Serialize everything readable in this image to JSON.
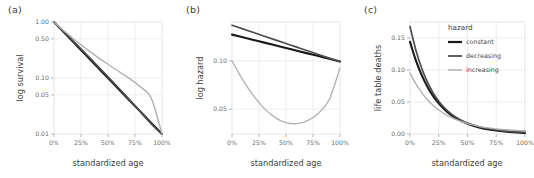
{
  "figure": {
    "background": "#ffffff",
    "panels": [
      {
        "letter": "(a)"
      },
      {
        "letter": "(b)"
      },
      {
        "letter": "(c)"
      }
    ]
  },
  "legend": {
    "title": "hazard",
    "position": "top-right-inside-panel-c",
    "items": [
      {
        "label": "constant",
        "color": "#1a1a1a"
      },
      {
        "label": "decreasing",
        "color": "#4d4d4d"
      },
      {
        "label": "increasing",
        "color": "#b3b3b3"
      }
    ]
  },
  "chart_data": [
    {
      "type": "line",
      "panel": "(a)",
      "title": "",
      "xlabel": "standardized age",
      "ylabel": "log survival",
      "xlim": [
        0,
        100
      ],
      "ylim": [
        0.01,
        1.0
      ],
      "yscale": "log",
      "grid": true,
      "xticks": [
        0,
        25,
        50,
        75,
        100
      ],
      "xticklabels": [
        "0%",
        "25%",
        "50%",
        "75%",
        "100%"
      ],
      "yticks": [
        1.0,
        0.5,
        0.1,
        0.05,
        0.01
      ],
      "yticklabels": [
        "1.00",
        "0.50",
        "0.10",
        "0.05",
        "0.01"
      ],
      "x": [
        0,
        10,
        20,
        30,
        40,
        50,
        60,
        70,
        80,
        90,
        100
      ],
      "series": [
        {
          "name": "constant",
          "color": "#1a1a1a",
          "values": [
            1.0,
            0.631,
            0.398,
            0.251,
            0.158,
            0.1,
            0.0631,
            0.0398,
            0.0251,
            0.0158,
            0.01
          ]
        },
        {
          "name": "decreasing",
          "color": "#4d4d4d",
          "values": [
            1.0,
            0.645,
            0.414,
            0.264,
            0.167,
            0.105,
            0.0655,
            0.0406,
            0.025,
            0.0152,
            0.01
          ]
        },
        {
          "name": "increasing",
          "color": "#b3b3b3",
          "values": [
            1.0,
            0.676,
            0.468,
            0.331,
            0.239,
            0.176,
            0.131,
            0.0972,
            0.0694,
            0.0437,
            0.01
          ]
        }
      ]
    },
    {
      "type": "line",
      "panel": "(b)",
      "title": "",
      "xlabel": "standardized age",
      "ylabel": "log hazard",
      "xlim": [
        0,
        100
      ],
      "ylim": [
        0.035,
        0.175
      ],
      "yscale": "log",
      "grid": true,
      "xticks": [
        0,
        25,
        50,
        75,
        100
      ],
      "xticklabels": [
        "0%",
        "25%",
        "50%",
        "75%",
        "100%"
      ],
      "yticks": [
        0.1,
        0.05
      ],
      "yticklabels": [
        "0.10",
        "0.05"
      ],
      "x": [
        0,
        10,
        20,
        30,
        40,
        50,
        60,
        70,
        80,
        90,
        100
      ],
      "series": [
        {
          "name": "constant",
          "color": "#1a1a1a",
          "values": [
            0.146,
            0.1405,
            0.1352,
            0.1301,
            0.1252,
            0.1204,
            0.1159,
            0.1115,
            0.1073,
            0.1032,
            0.0993
          ]
        },
        {
          "name": "decreasing",
          "color": "#4d4d4d",
          "values": [
            0.167,
            0.1585,
            0.1504,
            0.1427,
            0.1354,
            0.1285,
            0.1219,
            0.1157,
            0.1098,
            0.1042,
            0.0989
          ]
        },
        {
          "name": "increasing",
          "color": "#b3b3b3",
          "values": [
            0.1,
            0.0762,
            0.0605,
            0.0504,
            0.0443,
            0.0412,
            0.0406,
            0.0424,
            0.0472,
            0.0573,
            0.0905
          ]
        }
      ]
    },
    {
      "type": "line",
      "panel": "(c)",
      "title": "",
      "xlabel": "standardized age",
      "ylabel": "life table deaths",
      "xlim": [
        0,
        100
      ],
      "ylim": [
        0.0,
        0.175
      ],
      "yscale": "linear",
      "grid": true,
      "xticks": [
        0,
        25,
        50,
        75,
        100
      ],
      "xticklabels": [
        "0%",
        "25%",
        "50%",
        "75%",
        "100%"
      ],
      "yticks": [
        0.0,
        0.05,
        0.1,
        0.15
      ],
      "yticklabels": [
        "0.00",
        "0.05",
        "0.10",
        "0.15"
      ],
      "x": [
        0,
        5,
        10,
        15,
        20,
        25,
        30,
        35,
        40,
        45,
        50,
        60,
        70,
        80,
        90,
        100
      ],
      "series": [
        {
          "name": "constant",
          "color": "#1a1a1a",
          "values": [
            0.144,
            0.1155,
            0.0927,
            0.0744,
            0.0597,
            0.0479,
            0.0384,
            0.0308,
            0.0247,
            0.0198,
            0.0159,
            0.0102,
            0.0066,
            0.0042,
            0.0027,
            0.0017
          ]
        },
        {
          "name": "decreasing",
          "color": "#4d4d4d",
          "values": [
            0.168,
            0.1318,
            0.1036,
            0.0817,
            0.0646,
            0.0513,
            0.0408,
            0.0326,
            0.0262,
            0.0211,
            0.0171,
            0.0114,
            0.0078,
            0.0054,
            0.0038,
            0.0027
          ]
        },
        {
          "name": "increasing",
          "color": "#b3b3b3",
          "values": [
            0.0955,
            0.0787,
            0.0651,
            0.054,
            0.045,
            0.0376,
            0.0316,
            0.0266,
            0.0225,
            0.0191,
            0.0163,
            0.012,
            0.0091,
            0.0071,
            0.0058,
            0.005
          ]
        }
      ]
    }
  ]
}
